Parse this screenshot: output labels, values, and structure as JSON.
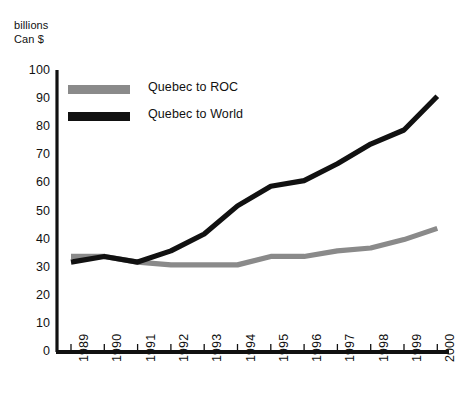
{
  "chart_data": {
    "type": "line",
    "title": "",
    "ylabel": "billions\nCan $",
    "xlabel": "",
    "categories": [
      "1989",
      "1990",
      "1991",
      "1992",
      "1993",
      "1994",
      "1995",
      "1996",
      "1997",
      "1998",
      "1999",
      "2000"
    ],
    "yticks": [
      0,
      10,
      20,
      30,
      40,
      50,
      60,
      70,
      80,
      90,
      100
    ],
    "ylim": [
      0,
      100
    ],
    "grid": false,
    "legend_position": "top-left-inside",
    "series": [
      {
        "name": "Quebec to ROC",
        "color": "#8a8a8a",
        "values": [
          34,
          34,
          32,
          31,
          31,
          31,
          34,
          34,
          36,
          37,
          40,
          44
        ]
      },
      {
        "name": "Quebec to World",
        "color": "#111111",
        "values": [
          32,
          34,
          32,
          36,
          42,
          52,
          59,
          61,
          67,
          74,
          79,
          91
        ]
      }
    ]
  },
  "axis": {
    "y_title": "billions\nCan $"
  },
  "legend": {
    "items": [
      {
        "label": "Quebec to ROC",
        "color": "#8a8a8a"
      },
      {
        "label": "Quebec to World",
        "color": "#111111"
      }
    ]
  }
}
